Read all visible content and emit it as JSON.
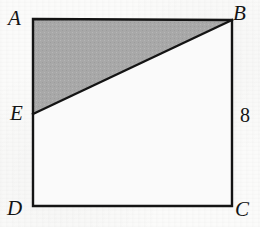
{
  "figure": {
    "kind": "geometry-diagram",
    "background_color": "#fbfbfa",
    "stroke_color": "#141414",
    "shaded_fill_color": "#a8a8a8",
    "interior_fill_color": "#fafafa"
  },
  "labels": {
    "a": "A",
    "b": "B",
    "c": "C",
    "d": "D",
    "e": "E",
    "side_bc": "8"
  },
  "geometry": {
    "square": {
      "left": 33,
      "top": 19,
      "right": 232,
      "bottom": 206,
      "width": 199,
      "height": 187
    },
    "points": {
      "A": {
        "x": 33,
        "y": 19
      },
      "B": {
        "x": 232,
        "y": 20
      },
      "C": {
        "x": 232,
        "y": 206
      },
      "D": {
        "x": 33,
        "y": 206
      },
      "E": {
        "x": 33,
        "y": 114
      }
    },
    "shaded_region": {
      "name": "triangle-ABE",
      "vertices": [
        "A",
        "B",
        "E"
      ]
    },
    "diagonal_segment": {
      "name": "segment-EB",
      "from": "E",
      "to": "B"
    }
  }
}
